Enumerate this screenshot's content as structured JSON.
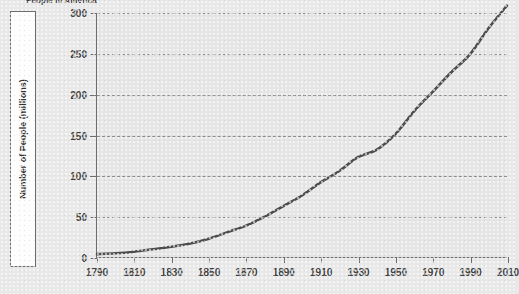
{
  "title": "People in America",
  "axes": {
    "ylabel": "Number of People (millions)",
    "xlabel": "",
    "yticks": [
      0,
      50,
      100,
      150,
      200,
      250,
      300
    ],
    "xticks": [
      1790,
      1810,
      1830,
      1850,
      1870,
      1890,
      1910,
      1930,
      1950,
      1970,
      1990,
      2010
    ]
  },
  "colors": {
    "line": "#4d4d4d",
    "grid": "#8d8d8d",
    "axis": "#6d6d6d",
    "background": "#e8e8e8",
    "plot_background": "#e2e2e2",
    "text": "#3f3f3f"
  },
  "chart_data": {
    "type": "line",
    "title": "People in America",
    "xlabel": "",
    "ylabel": "Number of People (millions)",
    "xlim": [
      1790,
      2010
    ],
    "ylim": [
      0,
      300
    ],
    "grid": true,
    "legend": "none",
    "x": [
      1790,
      1800,
      1810,
      1820,
      1830,
      1840,
      1850,
      1860,
      1870,
      1880,
      1890,
      1900,
      1910,
      1920,
      1930,
      1940,
      1950,
      1960,
      1970,
      1980,
      1990,
      2000,
      2010
    ],
    "series": [
      {
        "name": "U.S. Population",
        "values": [
          4,
          5,
          7,
          10,
          13,
          17,
          23,
          31,
          39,
          50,
          63,
          76,
          92,
          106,
          123,
          132,
          151,
          179,
          203,
          227,
          249,
          281,
          309
        ]
      }
    ]
  }
}
